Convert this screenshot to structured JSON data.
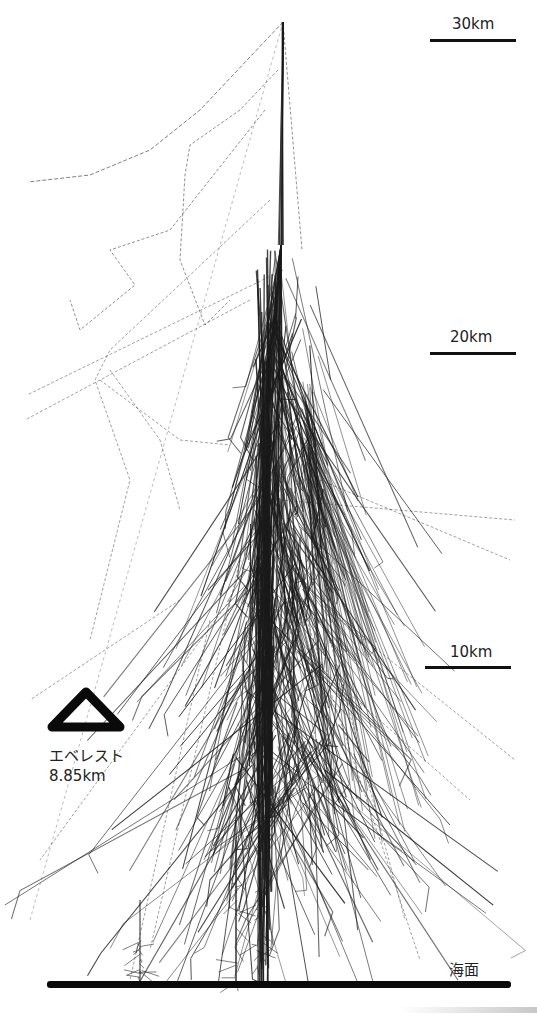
{
  "figure": {
    "colors": {
      "track": "#1a1a1a",
      "ground": "#0a0a0a",
      "background": "#ffffff"
    },
    "scale_markers": [
      {
        "label": "30km",
        "altitude_km": 30,
        "bar_y": 40,
        "label_y": 15,
        "bar_x": 430,
        "bar_w": 86
      },
      {
        "label": "20km",
        "altitude_km": 20,
        "bar_y": 353,
        "label_y": 328,
        "bar_x": 430,
        "bar_w": 86
      },
      {
        "label": "10km",
        "altitude_km": 10,
        "bar_y": 667,
        "label_y": 643,
        "bar_x": 425,
        "bar_w": 86
      }
    ],
    "everest": {
      "name": "エベレスト",
      "height_label": "8.85km",
      "altitude_km": 8.85,
      "icon": "triangle-mountain-icon"
    },
    "sea_level": {
      "label": "海面",
      "altitude_km": 0
    },
    "shower": {
      "origin": {
        "x": 283,
        "y": 22
      },
      "core_x": 265,
      "first_interaction_y": 245,
      "ground_y": 984,
      "seed": 7,
      "num_tracks": 420
    }
  }
}
